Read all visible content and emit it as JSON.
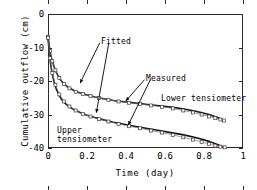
{
  "chart_data": {
    "type": "line",
    "title": "",
    "xlabel": "Time   (day)",
    "ylabel": "Cumulative outflow  (cm)",
    "xlim": [
      0,
      1
    ],
    "ylim": [
      -40,
      0
    ],
    "xticks": [
      0,
      0.2,
      0.4,
      0.6,
      0.8,
      1
    ],
    "xtick_labels": [
      "0",
      "0.2",
      "0.4",
      "0.6",
      "0.8",
      "1"
    ],
    "yticks": [
      0,
      -10,
      -20,
      -30,
      -40
    ],
    "ytick_labels": [
      "0",
      "-10",
      "-20",
      "-30",
      "-40"
    ],
    "grid": false,
    "legend": "none",
    "annotations": [
      {
        "text": "Fitted",
        "x": 0.28,
        "y": -6.8
      },
      {
        "text": "Measured",
        "x": 0.51,
        "y": -17.8
      },
      {
        "text": "Lower tensiometer",
        "x": 0.58,
        "y": -23.8
      },
      {
        "text": "Upper",
        "x": 0.05,
        "y": -33.2
      },
      {
        "text": "tensiometer",
        "x": 0.05,
        "y": -35.8
      }
    ],
    "series": [
      {
        "name": "Lower tensiometer fitted",
        "style": "solid-line",
        "x": [
          0.0,
          0.004,
          0.008,
          0.013,
          0.019,
          0.026,
          0.034,
          0.044,
          0.056,
          0.07,
          0.088,
          0.11,
          0.135,
          0.165,
          0.2,
          0.24,
          0.285,
          0.335,
          0.39,
          0.45,
          0.51,
          0.57,
          0.63,
          0.69,
          0.745,
          0.79,
          0.83,
          0.865,
          0.89,
          0.905
        ],
        "y": [
          -6.5,
          -8.6,
          -10.3,
          -11.9,
          -13.4,
          -14.8,
          -16.2,
          -17.6,
          -18.9,
          -20.1,
          -21.2,
          -22.1,
          -22.9,
          -23.6,
          -24.2,
          -24.8,
          -25.3,
          -25.8,
          -26.2,
          -26.6,
          -27.0,
          -27.4,
          -27.8,
          -28.3,
          -28.9,
          -29.5,
          -30.1,
          -30.8,
          -31.4,
          -31.8
        ]
      },
      {
        "name": "Lower tensiometer measured",
        "style": "open-symbols",
        "x": [
          0.0,
          0.01,
          0.022,
          0.038,
          0.058,
          0.082,
          0.11,
          0.142,
          0.178,
          0.218,
          0.262,
          0.31,
          0.362,
          0.416,
          0.472,
          0.528,
          0.584,
          0.64,
          0.694,
          0.744,
          0.788,
          0.826,
          0.858,
          0.884,
          0.903
        ],
        "y": [
          -6.8,
          -11.0,
          -14.1,
          -16.8,
          -19.1,
          -20.9,
          -22.2,
          -23.2,
          -23.9,
          -24.5,
          -25.1,
          -25.6,
          -26.1,
          -26.5,
          -26.9,
          -27.3,
          -27.7,
          -28.2,
          -28.8,
          -29.4,
          -30.0,
          -30.6,
          -31.1,
          -31.5,
          -31.8
        ]
      },
      {
        "name": "Upper tensiometer fitted",
        "style": "solid-line",
        "x": [
          0.0,
          0.004,
          0.008,
          0.013,
          0.019,
          0.026,
          0.034,
          0.044,
          0.056,
          0.07,
          0.088,
          0.11,
          0.135,
          0.165,
          0.2,
          0.24,
          0.285,
          0.335,
          0.39,
          0.45,
          0.51,
          0.57,
          0.63,
          0.69,
          0.745,
          0.79,
          0.83,
          0.865,
          0.89,
          0.908
        ],
        "y": [
          -6.9,
          -9.8,
          -12.4,
          -14.8,
          -17.0,
          -19.0,
          -20.9,
          -22.6,
          -24.1,
          -25.5,
          -26.7,
          -27.7,
          -28.6,
          -29.4,
          -30.2,
          -30.9,
          -31.6,
          -32.3,
          -32.9,
          -33.6,
          -34.2,
          -34.8,
          -35.4,
          -36.0,
          -36.7,
          -37.4,
          -38.1,
          -38.9,
          -39.5,
          -39.8
        ]
      },
      {
        "name": "Upper tensiometer measured",
        "style": "open-symbols",
        "x": [
          0.0,
          0.01,
          0.022,
          0.038,
          0.058,
          0.082,
          0.11,
          0.142,
          0.178,
          0.218,
          0.262,
          0.31,
          0.362,
          0.416,
          0.472,
          0.528,
          0.584,
          0.64,
          0.694,
          0.744,
          0.788,
          0.826,
          0.858,
          0.884,
          0.906
        ],
        "y": [
          -7.1,
          -13.2,
          -17.6,
          -21.2,
          -24.0,
          -26.1,
          -27.6,
          -28.8,
          -29.8,
          -30.6,
          -31.4,
          -32.1,
          -32.8,
          -33.5,
          -34.1,
          -34.8,
          -35.4,
          -36.1,
          -36.8,
          -37.5,
          -38.2,
          -38.8,
          -39.3,
          -39.6,
          -39.8
        ]
      }
    ]
  },
  "arrows": [
    {
      "name": "fitted-to-lower",
      "x1": 0.265,
      "y1": -8.6,
      "x2": 0.165,
      "y2": -20.6
    },
    {
      "name": "fitted-to-upper",
      "x1": 0.312,
      "y1": -8.6,
      "x2": 0.248,
      "y2": -29.4
    },
    {
      "name": "measured-to-lower",
      "x1": 0.495,
      "y1": -19.6,
      "x2": 0.4,
      "y2": -25.9
    },
    {
      "name": "measured-to-upper",
      "x1": 0.525,
      "y1": -19.6,
      "x2": 0.412,
      "y2": -33.1
    }
  ]
}
